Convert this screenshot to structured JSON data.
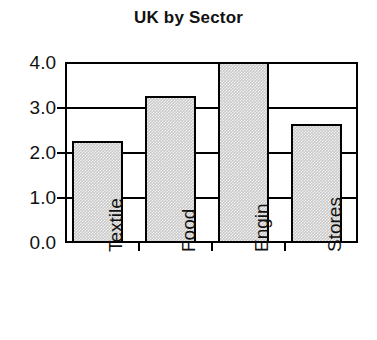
{
  "chart_data": {
    "type": "bar",
    "title": "UK by Sector",
    "xlabel": "",
    "ylabel": "",
    "categories": [
      "Textile",
      "Food",
      "Engin",
      "Stores"
    ],
    "values": [
      2.25,
      3.25,
      4.0,
      2.63
    ],
    "ylim": [
      0.0,
      4.0
    ],
    "ytick_labels": [
      "0.0",
      "1.0",
      "2.0",
      "3.0",
      "4.0"
    ],
    "ytick_values": [
      0.0,
      1.0,
      2.0,
      3.0,
      4.0
    ],
    "grid": "horizontal",
    "legend": "none",
    "bar_fill_color": "#c9c9c9",
    "bar_edge_color": "#000000",
    "axis_color": "#000000",
    "background_color": "#ffffff"
  }
}
